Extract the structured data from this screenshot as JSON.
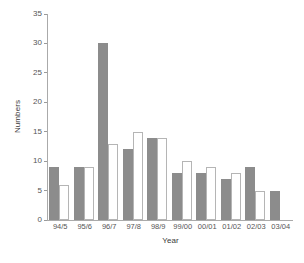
{
  "chart_data": {
    "type": "bar",
    "title": "",
    "xlabel": "Year",
    "ylabel": "Numbers",
    "categories": [
      "94/5",
      "95/6",
      "96/7",
      "97/8",
      "98/9",
      "99/00",
      "00/01",
      "01/02",
      "02/03",
      "03/04"
    ],
    "series": [
      {
        "name": "series-filled",
        "style": "filled-grey",
        "color": "#8c8c8c",
        "values": [
          9,
          9,
          30,
          12,
          14,
          8,
          8,
          7,
          9,
          5
        ]
      },
      {
        "name": "series-open",
        "style": "open-white",
        "color": "#ffffff",
        "border_color": "#b5b5b5",
        "values": [
          6,
          9,
          13,
          15,
          14,
          10,
          9,
          8,
          5,
          null
        ]
      }
    ],
    "ylim": [
      0,
      35
    ],
    "yticks": [
      0,
      5,
      10,
      15,
      20,
      25,
      30,
      35
    ],
    "ytick_labels": [
      "0",
      "5",
      "10",
      "15",
      "20",
      "25",
      "30",
      "35"
    ],
    "grid": false,
    "legend": "none",
    "axis_color": "#aaaaaa",
    "text_color": "#555555"
  }
}
